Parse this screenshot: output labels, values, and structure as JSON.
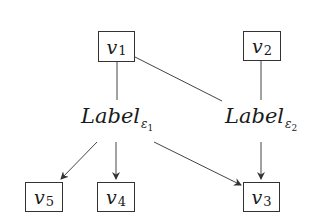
{
  "diagram": {
    "nodes": {
      "v1": {
        "base": "v",
        "sub": "1"
      },
      "v2": {
        "base": "v",
        "sub": "2"
      },
      "v3": {
        "base": "v",
        "sub": "3"
      },
      "v4": {
        "base": "v",
        "sub": "4"
      },
      "v5": {
        "base": "v",
        "sub": "5"
      }
    },
    "labels": {
      "e1": {
        "text": "Label",
        "eps": "ε",
        "sub": "1"
      },
      "e2": {
        "text": "Label",
        "eps": "ε",
        "sub": "2"
      }
    },
    "edges": [
      {
        "from": "v1",
        "to": "Label_e1",
        "type": "line"
      },
      {
        "from": "v1",
        "to": "Label_e2",
        "type": "line"
      },
      {
        "from": "v2",
        "to": "Label_e2",
        "type": "line"
      },
      {
        "from": "Label_e1",
        "to": "v5",
        "type": "arrow"
      },
      {
        "from": "Label_e1",
        "to": "v4",
        "type": "arrow"
      },
      {
        "from": "Label_e1",
        "to": "v3",
        "type": "arrow"
      },
      {
        "from": "Label_e2",
        "to": "v3",
        "type": "arrow"
      }
    ],
    "colors": {
      "stroke": "#333333",
      "text": "#1a1a1a",
      "background": "#ffffff"
    }
  }
}
